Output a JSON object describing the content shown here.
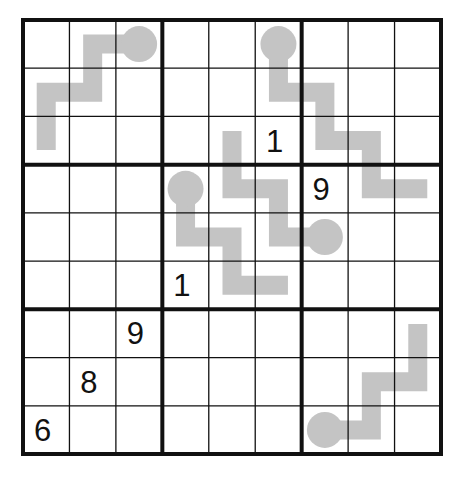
{
  "puzzle": {
    "type": "thermo-sudoku",
    "size": 9,
    "box_size": 3,
    "grid": {
      "left": 23,
      "top": 20,
      "right": 441,
      "bottom": 454,
      "thin_line_width": 1.3,
      "thick_line_width": 4,
      "line_color": "#111111"
    },
    "givens": [
      {
        "row": 3,
        "col": 6,
        "value": "1"
      },
      {
        "row": 4,
        "col": 7,
        "value": "9"
      },
      {
        "row": 6,
        "col": 4,
        "value": "1"
      },
      {
        "row": 7,
        "col": 3,
        "value": "9"
      },
      {
        "row": 8,
        "col": 2,
        "value": "8"
      },
      {
        "row": 9,
        "col": 1,
        "value": "6"
      }
    ],
    "thermometers": [
      {
        "name": "thermo-top-left",
        "bulb": [
          1,
          3
        ],
        "path": [
          [
            1,
            3
          ],
          [
            1,
            2
          ],
          [
            2,
            2
          ],
          [
            2,
            1
          ],
          [
            3,
            1
          ]
        ]
      },
      {
        "name": "thermo-top-right",
        "bulb": [
          1,
          6
        ],
        "path": [
          [
            1,
            6
          ],
          [
            2,
            6
          ],
          [
            2,
            7
          ],
          [
            3,
            7
          ],
          [
            3,
            8
          ],
          [
            4,
            8
          ],
          [
            4,
            9
          ]
        ]
      },
      {
        "name": "thermo-center-left",
        "bulb": [
          4,
          4
        ],
        "path": [
          [
            4,
            4
          ],
          [
            5,
            4
          ],
          [
            5,
            5
          ],
          [
            6,
            5
          ],
          [
            6,
            6
          ]
        ]
      },
      {
        "name": "thermo-center-right",
        "bulb": [
          5,
          7
        ],
        "path": [
          [
            5,
            7
          ],
          [
            5,
            6
          ],
          [
            4,
            6
          ],
          [
            4,
            5
          ],
          [
            3,
            5
          ]
        ]
      },
      {
        "name": "thermo-bottom-right",
        "bulb": [
          9,
          7
        ],
        "path": [
          [
            9,
            7
          ],
          [
            9,
            8
          ],
          [
            8,
            8
          ],
          [
            8,
            9
          ],
          [
            7,
            9
          ]
        ]
      }
    ],
    "colors": {
      "thermometer": "#c4c4c4",
      "digit": "#111111",
      "background": "#ffffff"
    }
  }
}
